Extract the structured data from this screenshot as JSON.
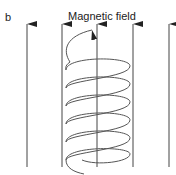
{
  "figure": {
    "panel_label": "b",
    "title": "Magnetic field",
    "field_lines": [
      {
        "x": 27,
        "direction": "up"
      },
      {
        "x": 62,
        "direction": "up"
      },
      {
        "x": 97,
        "direction": "up"
      },
      {
        "x": 133,
        "direction": "up"
      },
      {
        "x": 169,
        "direction": "up"
      }
    ],
    "coil": {
      "turns": 6,
      "center_x": 97,
      "current_arrow": "counterclockwise-top"
    },
    "colors": {
      "lines": "#333333",
      "text": "#222222",
      "background": "#ffffff"
    }
  }
}
